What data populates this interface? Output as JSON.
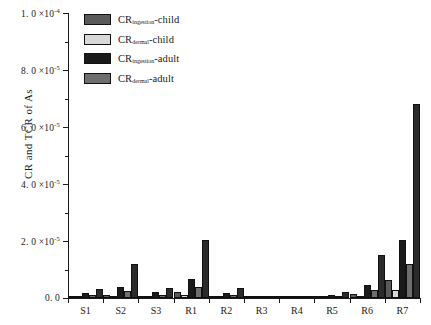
{
  "chart_data": {
    "type": "bar",
    "title": "",
    "xlabel": "",
    "ylabel": "CR and TCR of As",
    "ylim": [
      0,
      0.0001
    ],
    "grid": false,
    "legend_position": "top-left",
    "categories": [
      "S1",
      "S2",
      "S3",
      "R1",
      "R2",
      "R3",
      "R4",
      "R5",
      "R6",
      "R7"
    ],
    "ytick_values": [
      0,
      2e-05,
      4e-05,
      6e-05,
      8e-05,
      0.0001
    ],
    "ytick_labels": [
      "0. 0",
      "2. 0 ×10",
      "4. 0 ×10",
      "6. 0 ×10",
      "8. 0 ×10",
      "1. 0 ×10"
    ],
    "ytick_exponents": [
      "",
      "-5",
      "-5",
      "-5",
      "-5",
      "-4"
    ],
    "series": [
      {
        "name": "CR_ingestion-child",
        "label_main": "CR",
        "label_sub": "ingestion",
        "label_tail": "-child",
        "color": "#5a5a5a",
        "values": [
          4e-07,
          1.2e-06,
          6e-07,
          2e-06,
          5e-07,
          1e-07,
          0.0,
          3e-07,
          1.4e-06,
          6.2e-06
        ]
      },
      {
        "name": "CR_dermal-child",
        "label_main": "CR",
        "label_sub": "dermal",
        "label_tail": "-child",
        "color": "#d8d8d8",
        "values": [
          2e-07,
          5e-07,
          3e-07,
          9e-07,
          2e-07,
          0.0,
          0.0,
          1e-07,
          6e-07,
          2.7e-06
        ]
      },
      {
        "name": "CR_ingestion-adult",
        "label_main": "CR",
        "label_sub": "ingestion",
        "label_tail": "-adult",
        "color": "#1a1a1a",
        "values": [
          1.6e-06,
          3.9e-06,
          2.1e-06,
          6.5e-06,
          1.8e-06,
          3e-07,
          1e-07,
          1.1e-06,
          4.6e-06,
          2.05e-05
        ]
      },
      {
        "name": "CR_dermal-adult",
        "label_main": "CR",
        "label_sub": "dermal",
        "label_tail": "-adult",
        "color": "#6e6e6e",
        "values": [
          9e-07,
          2.3e-06,
          1.2e-06,
          3.8e-06,
          1e-06,
          2e-07,
          1e-07,
          6e-07,
          2.7e-06,
          1.2e-05
        ]
      },
      {
        "name": "TCR",
        "label_main": "TCR",
        "label_sub": "",
        "label_tail": "",
        "color": "#2b2b2b",
        "values": [
          3e-06,
          1.2e-05,
          3.5e-06,
          2.05e-05,
          3.5e-06,
          6e-07,
          2e-07,
          2e-06,
          1.5e-05,
          6.8e-05
        ]
      }
    ]
  }
}
